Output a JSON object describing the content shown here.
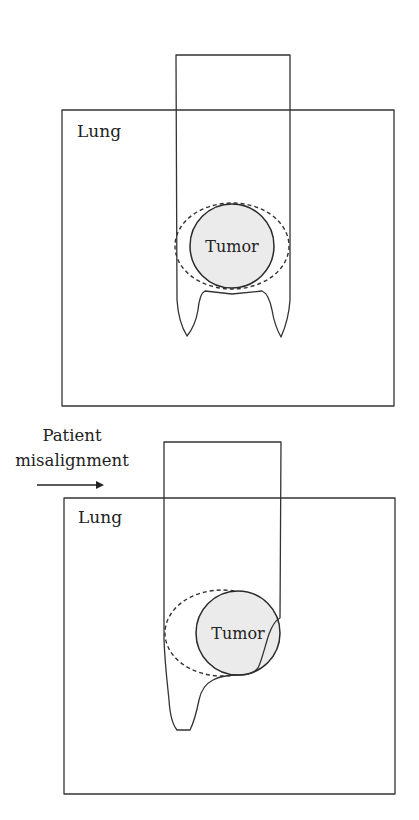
{
  "colors": {
    "stroke": "#333333",
    "tumor_fill": "#ebebeb",
    "background": "#ffffff",
    "text": "#222222"
  },
  "panels": [
    {
      "id": "aligned",
      "organ_label": "Lung",
      "target_label": "Tumor",
      "lung_box": {
        "x": 62,
        "y": 110,
        "w": 332,
        "h": 296
      },
      "beam_top": {
        "x1": 176,
        "x2": 290,
        "y": 55
      },
      "tumor": {
        "cx": 232,
        "cy": 246,
        "r": 42
      },
      "margin_ellipse": {
        "cx": 232,
        "cy": 246,
        "rx": 57,
        "ry": 43
      }
    },
    {
      "id": "misaligned",
      "organ_label": "Lung",
      "target_label": "Tumor",
      "lung_box": {
        "x": 64,
        "y": 498,
        "w": 331,
        "h": 296
      },
      "beam_top": {
        "x1": 164,
        "x2": 281,
        "y": 442
      },
      "tumor": {
        "cx": 238,
        "cy": 633,
        "r": 42
      },
      "margin_ellipse": {
        "cx": 222,
        "cy": 633,
        "rx": 57,
        "ry": 43
      }
    }
  ],
  "annotation": {
    "line1": "Patient",
    "line2": "misalignment",
    "arrow_direction": "right"
  }
}
